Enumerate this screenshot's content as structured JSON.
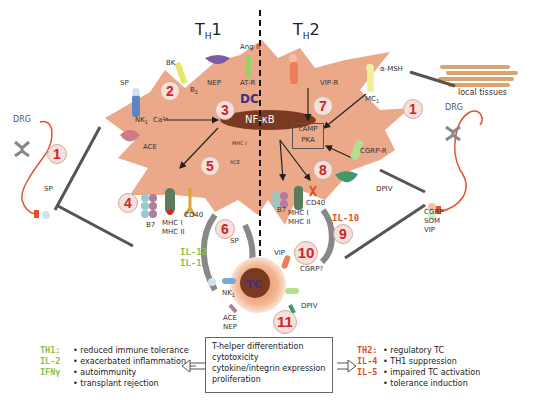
{
  "titles": {
    "th1": "T",
    "th1_sub": "H",
    "th1_num": "1",
    "th2": "T",
    "th2_sub": "H",
    "th2_num": "2"
  },
  "cell_labels": {
    "dc": "DC",
    "nfkb": "NF-κB",
    "camp": "cAMP",
    "pka": "PKA",
    "tc": "TC"
  },
  "numbers": [
    "1",
    "2",
    "3",
    "4",
    "5",
    "6",
    "7",
    "8",
    "9",
    "10",
    "11"
  ],
  "left_labels": {
    "drg": "DRG",
    "sp_left": "SP",
    "sp_top": "SP",
    "nk1": "NK",
    "nk1_sub": "1",
    "ca": "Ca²⁺",
    "ace": "ACE",
    "bk": "BK",
    "b2": "B",
    "b2_sub": "2",
    "nep": "NEP",
    "ang2": "Ang II",
    "atr": "AT-R",
    "mhc1_small": "MHC I",
    "ace_small": "ACE",
    "b7": "B7",
    "mhc1": "MHC I",
    "mhc2": "MHC II",
    "cd40": "CD40",
    "sp6": "SP"
  },
  "right_labels": {
    "local_tissues": "local tissues",
    "drg": "DRG",
    "amsh": "α-MSH",
    "mc": "MC",
    "mc_sub": "1",
    "vipr": "VIP-R",
    "cgrpr": "CGRP-R",
    "dpiv": "DPIV",
    "cgrp": "CGRP",
    "som": "SOM",
    "vip": "VIP",
    "b7": "B7",
    "mhc1": "MHC I",
    "mhc2": "MHC II",
    "cd40": "CD40"
  },
  "tc_labels": {
    "nk1": "NK",
    "nk1_sub": "1",
    "ace": "ACE",
    "nep": "NEP",
    "vip": "VIP",
    "cgrp": "CGRP?",
    "dpiv": "DPIV"
  },
  "cytokines": {
    "il12": "IL-12",
    "il1": "IL-1",
    "il10": "IL-10"
  },
  "center_box": [
    "T-helper differentiation",
    "cytotoxicity",
    "cytokine/integrin expression",
    "proliferation"
  ],
  "th1_effects": {
    "keys": [
      "TH1:",
      "IL-2",
      "IFNγ"
    ],
    "items": [
      "reduced immune tolerance",
      "exacerbated inflammation",
      "autoimmunity",
      "transplant rejection"
    ]
  },
  "th2_effects": {
    "keys": [
      "TH2:",
      "IL-4",
      "IL-5"
    ],
    "items": [
      "regulatory TC",
      "TH1 suppression",
      "impaired TC activation",
      "tolerance induction"
    ]
  },
  "colors": {
    "cell": "#eba98a",
    "nfkb": "#7a3a22",
    "number_red": "#d2232a",
    "th1_green": "#8fc044",
    "th2_red": "#d9501f",
    "nerve": "#e4512a"
  }
}
